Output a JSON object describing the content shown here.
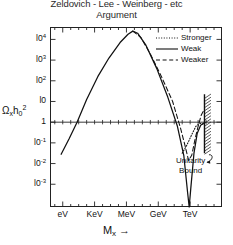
{
  "title": {
    "line1": "Zeldovich - Lee - Weinberg - etc",
    "line2": "Argument"
  },
  "axes": {
    "ylabel_omega": "Ω",
    "ylabel_sub_x": "x",
    "ylabel_h": "h",
    "ylabel_h_sub": "0",
    "ylabel_h_sup": "2",
    "xlabel_m": "M",
    "xlabel_sub": "x",
    "xlabel_arrow": "→"
  },
  "legend": [
    {
      "label": "Stronger",
      "style": "dotted",
      "color": "#111111"
    },
    {
      "label": "Weak",
      "style": "solid",
      "color": "#111111"
    },
    {
      "label": "Weaker",
      "style": "dashed",
      "color": "#111111"
    }
  ],
  "annotation": {
    "line1": "Unitarity",
    "line2": "Bound"
  },
  "chart_data": {
    "type": "line",
    "title": "Zeldovich - Lee - Weinberg - etc Argument",
    "xlabel": "M_x",
    "ylabel": "Ω_x h_0^2",
    "x_tick_labels": [
      "eV",
      "KeV",
      "MeV",
      "GeV",
      "TeV"
    ],
    "x_tick_positions": [
      0,
      1,
      2,
      3,
      4
    ],
    "x_minor_ticks_per_decade": 3,
    "xlim": [
      -0.4,
      5.0
    ],
    "y_tick_labels": [
      "10^4",
      "10^3",
      "10^2",
      "10",
      "1",
      "10^-1",
      "10^-2",
      "10^-3"
    ],
    "y_tick_values": [
      4,
      3,
      2,
      1,
      0,
      -1,
      -2,
      -3
    ],
    "ylim": [
      -4.1,
      4.6
    ],
    "grid": false,
    "legend_position": "top-right-inside",
    "reference_lines": [
      {
        "name": "omega-equals-one",
        "orientation": "horizontal",
        "y_value": 0,
        "style": "solid"
      },
      {
        "name": "unitarity-bound",
        "orientation": "vertical",
        "x_value": 4.45,
        "style": "hatched"
      }
    ],
    "series": [
      {
        "name": "Weak",
        "style": "solid",
        "points_log": [
          [
            -0.05,
            -1.55
          ],
          [
            0.2,
            -0.8
          ],
          [
            0.45,
            0.0
          ],
          [
            0.75,
            1.1
          ],
          [
            1.1,
            2.2
          ],
          [
            1.45,
            3.1
          ],
          [
            1.8,
            3.85
          ],
          [
            2.05,
            4.25
          ],
          [
            2.2,
            4.4
          ],
          [
            2.35,
            4.3
          ],
          [
            2.6,
            3.75
          ],
          [
            2.95,
            2.6
          ],
          [
            3.3,
            1.2
          ],
          [
            3.6,
            -0.2
          ],
          [
            3.8,
            -1.6
          ],
          [
            3.92,
            -3.4
          ],
          [
            3.97,
            -4.1
          ],
          [
            4.02,
            -3.2
          ],
          [
            4.12,
            -1.5
          ],
          [
            4.22,
            -0.55
          ],
          [
            4.33,
            -0.15
          ],
          [
            4.42,
            -0.05
          ]
        ]
      },
      {
        "name": "Weaker",
        "style": "dashed",
        "points_log": [
          [
            2.2,
            4.4
          ],
          [
            2.45,
            4.1
          ],
          [
            2.75,
            3.3
          ],
          [
            3.1,
            2.2
          ],
          [
            3.45,
            1.0
          ],
          [
            3.7,
            -0.3
          ],
          [
            3.85,
            -1.2
          ],
          [
            3.95,
            -1.85
          ],
          [
            4.05,
            -1.6
          ],
          [
            4.15,
            -0.85
          ],
          [
            4.25,
            -0.2
          ],
          [
            4.35,
            0.35
          ],
          [
            4.42,
            0.55
          ]
        ]
      },
      {
        "name": "Stronger",
        "style": "dotted",
        "points_log": [
          [
            3.75,
            -1.5
          ],
          [
            3.9,
            -1.1
          ],
          [
            4.05,
            -0.6
          ],
          [
            4.18,
            -0.2
          ],
          [
            4.3,
            -0.05
          ],
          [
            4.4,
            -0.1
          ]
        ]
      }
    ]
  }
}
